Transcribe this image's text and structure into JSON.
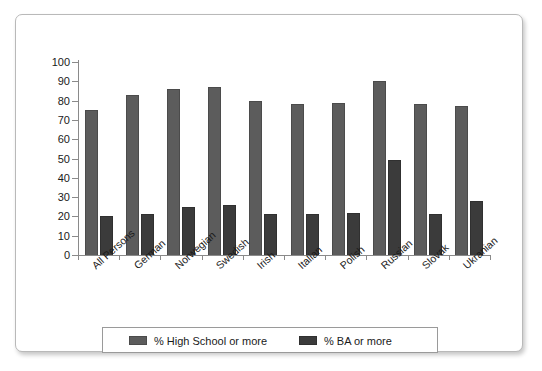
{
  "chart_data": {
    "type": "bar",
    "title": "",
    "xlabel": "",
    "ylabel": "",
    "ylim": [
      0,
      100
    ],
    "yticks": [
      0,
      10,
      20,
      30,
      40,
      50,
      60,
      70,
      80,
      90,
      100
    ],
    "grid": false,
    "legend_position": "bottom",
    "categories": [
      "All Persons",
      "German",
      "Norwegian",
      "Swedish",
      "Irish",
      "Italian",
      "Polish",
      "Russian",
      "Slovak",
      "Ukranian"
    ],
    "series": [
      {
        "name": "% High School or more",
        "color": "#5c5c5c",
        "values": [
          75,
          83,
          86,
          87,
          80,
          78,
          79,
          90,
          78,
          77
        ]
      },
      {
        "name": "% BA or more",
        "color": "#3b3b3b",
        "values": [
          20,
          21,
          25,
          26,
          21,
          21,
          22,
          49,
          21,
          28
        ]
      }
    ]
  },
  "legend": {
    "items": [
      {
        "label": "% High School or more"
      },
      {
        "label": "% BA or more"
      }
    ]
  },
  "axis": {
    "y_tick_labels": [
      "100",
      "90",
      "80",
      "70",
      "60",
      "50",
      "40",
      "30",
      "20",
      "10",
      "0"
    ]
  }
}
